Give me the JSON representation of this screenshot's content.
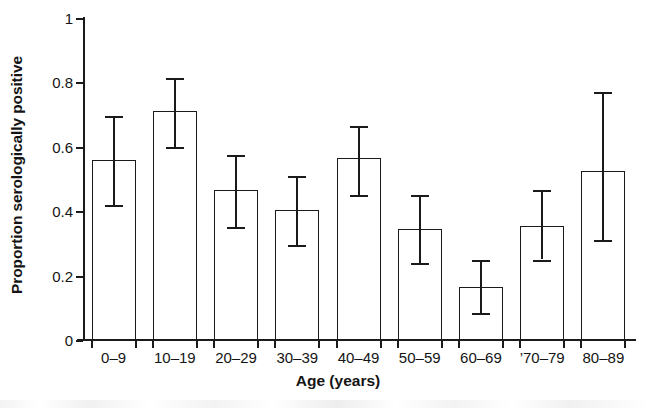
{
  "chart_data": {
    "type": "bar",
    "title": "",
    "xlabel": "Age (years)",
    "ylabel": "Proportion serologically positive",
    "categories": [
      "0–9",
      "10–19",
      "20–29",
      "30–39",
      "40–49",
      "50–59",
      "60–69",
      "’70–79",
      "80–89"
    ],
    "values": [
      0.56,
      0.71,
      0.465,
      0.405,
      0.565,
      0.345,
      0.165,
      0.355,
      0.525
    ],
    "error_low": [
      0.42,
      0.6,
      0.35,
      0.295,
      0.45,
      0.24,
      0.085,
      0.25,
      0.31
    ],
    "error_high": [
      0.695,
      0.815,
      0.575,
      0.51,
      0.665,
      0.45,
      0.25,
      0.465,
      0.77
    ],
    "ylim": [
      0,
      1
    ],
    "yticks": [
      0,
      0.2,
      0.4,
      0.6,
      0.8,
      1
    ],
    "ytick_labels": [
      "0",
      "0.2",
      "0.4",
      "0.6",
      "0.8",
      "1"
    ],
    "grid": false,
    "legend": "none",
    "error_bar_type": "95% confidence interval",
    "bar_style": "open / unfilled with black outline",
    "colors": {
      "bar_outline": "#1a1a1a",
      "bar_fill": "#ffffff",
      "error_bar": "#1a1a1a",
      "axis": "#1a1a1a",
      "text": "#141414",
      "background": "#ffffff"
    }
  }
}
